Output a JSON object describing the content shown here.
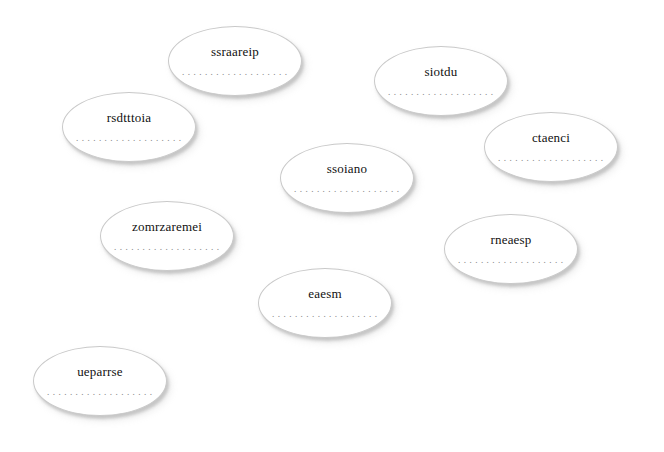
{
  "canvas": {
    "width": 664,
    "height": 452,
    "background_color": "#ffffff",
    "node_fill_color": "#ffffff",
    "node_border_color": "#c9c9c9",
    "node_label_color": "#111111",
    "node_dots_color": "#8a8a8a",
    "node_count": 10
  },
  "nodes": [
    {
      "id": "node-ssraareip",
      "label": "ssraareip",
      "dots": "...................",
      "x": 168,
      "y": 26,
      "width": 134,
      "height": 70
    },
    {
      "id": "node-siotdu",
      "label": "siotdu",
      "dots": "...................",
      "x": 374,
      "y": 46,
      "width": 134,
      "height": 70
    },
    {
      "id": "node-rsdtttoia",
      "label": "rsdtttoia",
      "dots": "...................",
      "x": 62,
      "y": 92,
      "width": 134,
      "height": 70
    },
    {
      "id": "node-ctaenci",
      "label": "ctaenci",
      "dots": "...................",
      "x": 484,
      "y": 112,
      "width": 134,
      "height": 70
    },
    {
      "id": "node-ssoiano",
      "label": "ssoiano",
      "dots": "...................",
      "x": 280,
      "y": 143,
      "width": 134,
      "height": 70
    },
    {
      "id": "node-zomrzaremei",
      "label": "zomrzaremei",
      "dots": "...................",
      "x": 100,
      "y": 201,
      "width": 134,
      "height": 70
    },
    {
      "id": "node-rneaesp",
      "label": "rneaesp",
      "dots": "...................",
      "x": 444,
      "y": 214,
      "width": 134,
      "height": 70
    },
    {
      "id": "node-eaesm",
      "label": "eaesm",
      "dots": "...................",
      "x": 258,
      "y": 268,
      "width": 134,
      "height": 70
    },
    {
      "id": "node-ueparrse",
      "label": "ueparrse",
      "dots": "...................",
      "x": 33,
      "y": 346,
      "width": 134,
      "height": 70
    }
  ]
}
